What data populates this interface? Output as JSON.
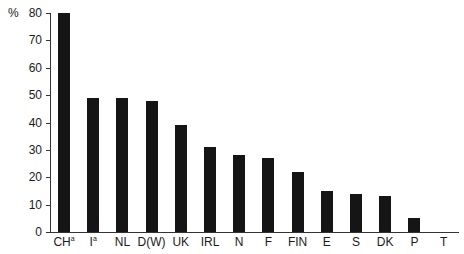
{
  "chart_data": {
    "type": "bar",
    "title": "",
    "xlabel": "",
    "ylabel": "%",
    "ylim": [
      0,
      80
    ],
    "yticks": [
      0,
      10,
      20,
      30,
      40,
      50,
      60,
      70,
      80
    ],
    "grid": false,
    "legend": null,
    "categories": [
      "CHa",
      "Ia",
      "NL",
      "D(W)",
      "UK",
      "IRL",
      "N",
      "F",
      "FIN",
      "E",
      "S",
      "DK",
      "P",
      "T"
    ],
    "category_labels": [
      {
        "base": "CH",
        "sup": "a"
      },
      {
        "base": "I",
        "sup": "a"
      },
      {
        "base": "NL",
        "sup": ""
      },
      {
        "base": "D(W)",
        "sup": ""
      },
      {
        "base": "UK",
        "sup": ""
      },
      {
        "base": "IRL",
        "sup": ""
      },
      {
        "base": "N",
        "sup": ""
      },
      {
        "base": "F",
        "sup": ""
      },
      {
        "base": "FIN",
        "sup": ""
      },
      {
        "base": "E",
        "sup": ""
      },
      {
        "base": "S",
        "sup": ""
      },
      {
        "base": "DK",
        "sup": ""
      },
      {
        "base": "P",
        "sup": ""
      },
      {
        "base": "T",
        "sup": ""
      }
    ],
    "values": [
      80,
      49,
      49,
      48,
      39,
      31,
      28,
      27,
      22,
      15,
      14,
      13,
      5,
      0
    ]
  }
}
